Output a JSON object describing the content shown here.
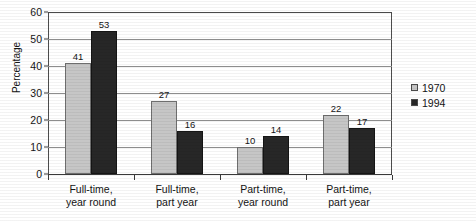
{
  "chart_data": {
    "type": "bar",
    "title": "",
    "xlabel": "",
    "ylabel": "Percentage",
    "ylim": [
      0,
      60
    ],
    "ytick_step": 10,
    "yticks": [
      0,
      10,
      20,
      30,
      40,
      50,
      60
    ],
    "grid": true,
    "legend_position": "right",
    "categories": [
      "Full-time,\nyear round",
      "Full-time,\npart year",
      "Part-time,\nyear round",
      "Part-time,\npart year"
    ],
    "category_lines": [
      [
        "Full-time,",
        "year round"
      ],
      [
        "Full-time,",
        "part year"
      ],
      [
        "Part-time,",
        "year round"
      ],
      [
        "Part-time,",
        "part year"
      ]
    ],
    "series": [
      {
        "name": "1970",
        "color": "#c6c6c6",
        "values": [
          41,
          27,
          10,
          22
        ]
      },
      {
        "name": "1994",
        "color": "#272727",
        "values": [
          53,
          16,
          14,
          17
        ]
      }
    ],
    "data_labels": [
      [
        "41",
        "53"
      ],
      [
        "27",
        "16"
      ],
      [
        "10",
        "14"
      ],
      [
        "22",
        "17"
      ]
    ]
  },
  "axis": {
    "y_title": "Percentage",
    "y_tick_labels": [
      "60",
      "50",
      "40",
      "30",
      "20",
      "10",
      "0"
    ]
  },
  "legend": {
    "items": [
      {
        "label": "1970"
      },
      {
        "label": "1994"
      }
    ]
  },
  "colors": {
    "series_1970": "#c6c6c6",
    "series_1994": "#272727",
    "axis": "#3a3a3a",
    "gridline": "#8d8d8d",
    "text": "#141414"
  }
}
